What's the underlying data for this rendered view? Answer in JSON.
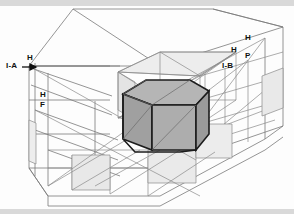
{
  "diagram": {
    "background_color": "#fdfdfd",
    "band_color": "#d9d9d9",
    "line_color": "#6e6e6e",
    "line_color_light": "#9a9a9a",
    "prism_outline_color": "#1e1e1e",
    "prism_top_fill": "#b5b5b5",
    "prism_left_fill": "#9d9d9d",
    "prism_right_fill": "#a8a8a8",
    "panel_fill": "#e6e6e6",
    "labels": [
      {
        "id": "label-i-a",
        "text": "I-A",
        "x": 6,
        "y": 64
      },
      {
        "id": "label-h-1",
        "text": "H",
        "x": 26,
        "y": 55
      },
      {
        "id": "label-h-2",
        "text": "H",
        "x": 40,
        "y": 92
      },
      {
        "id": "label-f-1",
        "text": "F",
        "x": 40,
        "y": 102
      },
      {
        "id": "label-h-3",
        "text": "H",
        "x": 232,
        "y": 45
      },
      {
        "id": "label-p-1",
        "text": "P",
        "x": 246,
        "y": 50
      },
      {
        "id": "label-h-4",
        "text": "H",
        "x": 245,
        "y": 36
      },
      {
        "id": "label-i-b",
        "text": "I-B",
        "x": 226,
        "y": 62
      }
    ]
  }
}
